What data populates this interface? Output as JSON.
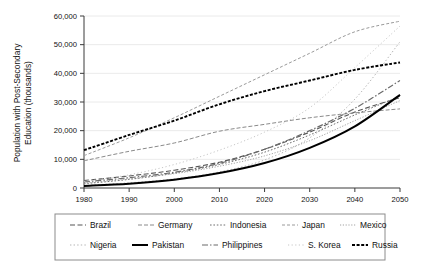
{
  "chart_data": {
    "type": "line",
    "title": "",
    "xlabel": "",
    "ylabel": "Population with Post-Secondary Education (thousands)",
    "ylabel_line1": "Population with Post-Secondary",
    "ylabel_line2": "Education (thousands)",
    "x": [
      1980,
      1990,
      2000,
      2010,
      2020,
      2030,
      2040,
      2050
    ],
    "xlim": [
      1980,
      2050
    ],
    "ylim": [
      0,
      60000
    ],
    "yticks": [
      0,
      10000,
      20000,
      30000,
      40000,
      50000,
      60000
    ],
    "ytick_labels": [
      "0",
      "10,000",
      "20,000",
      "30,000",
      "40,000",
      "50,000",
      "60,000"
    ],
    "xticks": [
      1980,
      1990,
      2000,
      2010,
      2020,
      2030,
      2040,
      2050
    ],
    "xtick_labels": [
      "1980",
      "1990",
      "2000",
      "2010",
      "2020",
      "2030",
      "2040",
      "2050"
    ],
    "grid": true,
    "grid_axis": "y",
    "legend_position": "bottom",
    "series": [
      {
        "name": "Brazil",
        "style": "dashed",
        "color": "#555555",
        "width": 1.1,
        "dash": "5,2.5",
        "values": [
          2600,
          4200,
          6200,
          9000,
          13500,
          19500,
          26500,
          31500
        ]
      },
      {
        "name": "Germany",
        "style": "dashed-medium",
        "color": "#8a8a8a",
        "width": 1.0,
        "dash": "4,2",
        "values": [
          9500,
          12800,
          15700,
          19800,
          22200,
          24500,
          26200,
          27600
        ]
      },
      {
        "name": "Indonesia",
        "style": "dotted",
        "color": "#6f6f6f",
        "width": 1.0,
        "dash": "1.6,1.8",
        "values": [
          1500,
          3000,
          5200,
          8200,
          12500,
          18500,
          25500,
          32000
        ]
      },
      {
        "name": "Japan",
        "style": "dash-fine",
        "color": "#9a9a9a",
        "width": 1.0,
        "dash": "3,2",
        "values": [
          11300,
          17500,
          24500,
          32000,
          39500,
          47000,
          54500,
          58200
        ]
      },
      {
        "name": "Mexico",
        "style": "dotted-fine",
        "color": "#9e9e9e",
        "width": 0.95,
        "dash": "1.2,1.6",
        "values": [
          1700,
          3200,
          5000,
          7600,
          11200,
          16500,
          23500,
          30500
        ]
      },
      {
        "name": "Nigeria",
        "style": "dotted-light",
        "color": "#b0b0b0",
        "width": 0.95,
        "dash": "1.4,2.2",
        "values": [
          900,
          1800,
          3200,
          5600,
          9800,
          17500,
          31000,
          51000
        ]
      },
      {
        "name": "Pakistan",
        "style": "solid-bold",
        "color": "#000000",
        "width": 2.0,
        "dash": "",
        "values": [
          700,
          1500,
          2900,
          5200,
          8700,
          14000,
          21500,
          32500
        ]
      },
      {
        "name": "Philippines",
        "style": "dash-dot",
        "color": "#6b6b6b",
        "width": 1.2,
        "dash": "6,2,1.5,2",
        "values": [
          2100,
          3600,
          5500,
          8600,
          13500,
          20000,
          27800,
          37500
        ]
      },
      {
        "name": "S. Korea",
        "style": "dotted-faint",
        "color": "#c4c4c4",
        "width": 0.95,
        "dash": "1.2,2.4",
        "values": [
          2300,
          4600,
          8200,
          13200,
          19500,
          28000,
          42000,
          56500
        ]
      },
      {
        "name": "Russia",
        "style": "dashed-bold",
        "color": "#000000",
        "width": 1.9,
        "dash": "3,1.6",
        "values": [
          13200,
          18500,
          23500,
          29200,
          33800,
          37500,
          41200,
          43800
        ]
      }
    ]
  },
  "legend": {
    "rows": [
      [
        "Brazil",
        "Germany",
        "Indonesia",
        "Japan",
        "Mexico"
      ],
      [
        "Nigeria",
        "Pakistan",
        "Philippines",
        "S. Korea",
        "Russia"
      ]
    ]
  }
}
